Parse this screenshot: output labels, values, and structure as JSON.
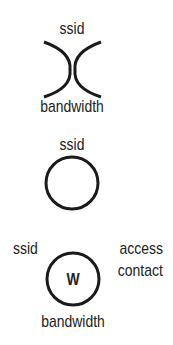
{
  "symbols": [
    {
      "id": "symbol-1",
      "shape": "opposing-arcs",
      "labels": {
        "top": "ssid",
        "bottom": "bandwidth"
      }
    },
    {
      "id": "symbol-2",
      "shape": "circle",
      "labels": {
        "top": "ssid"
      }
    },
    {
      "id": "symbol-3",
      "shape": "circle-with-letter",
      "letter": "W",
      "labels": {
        "top_left": "ssid",
        "top_right": "access",
        "right": "contact",
        "bottom": "bandwidth"
      }
    }
  ],
  "colors": {
    "stroke": "#1a1a1a",
    "text": "#222222",
    "background": "#ffffff"
  }
}
